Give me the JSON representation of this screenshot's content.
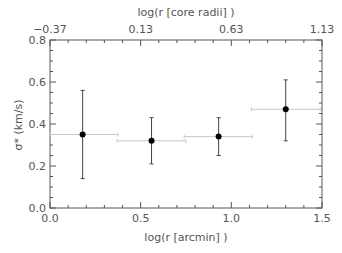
{
  "chart_data": {
    "type": "scatter",
    "title": "",
    "xlabel": "log(r [arcmin] )",
    "ylabel": "σ* (km/s)",
    "top_xlabel": "log(r [core radii] )",
    "xlim": [
      0.0,
      1.5
    ],
    "ylim": [
      0.0,
      0.8
    ],
    "top_xlim": [
      -0.37,
      1.13
    ],
    "x_ticks": [
      "0.0",
      "0.5",
      "1.0",
      "1.5"
    ],
    "y_ticks": [
      "0.0",
      "0.2",
      "0.4",
      "0.6",
      "0.8"
    ],
    "top_x_ticks": [
      "-0.37",
      "0.13",
      "0.63",
      "1.13"
    ],
    "grid": false,
    "legend": null,
    "points": [
      {
        "x": 0.18,
        "y": 0.35,
        "y_err_low": 0.14,
        "y_err_high": 0.56,
        "bin_low": 0.0,
        "bin_high": 0.375
      },
      {
        "x": 0.56,
        "y": 0.32,
        "y_err_low": 0.21,
        "y_err_high": 0.43,
        "bin_low": 0.37,
        "bin_high": 0.75
      },
      {
        "x": 0.93,
        "y": 0.34,
        "y_err_low": 0.25,
        "y_err_high": 0.43,
        "bin_low": 0.74,
        "bin_high": 1.115
      },
      {
        "x": 1.3,
        "y": 0.47,
        "y_err_low": 0.32,
        "y_err_high": 0.61,
        "bin_low": 1.11,
        "bin_high": 1.49
      }
    ],
    "colors": {
      "axis": "#555555",
      "point": "#000000",
      "error_bar": "#444444",
      "bin_line": "#c8c8c8"
    }
  }
}
